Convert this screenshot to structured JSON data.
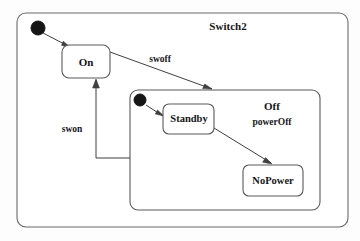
{
  "diagram": {
    "kind": "uml-state-machine",
    "background_color": "#fdfdfd",
    "line_color": "#4a4a4a",
    "text_color": "#16161a",
    "fill_color": "#ffffff"
  },
  "outer_state": {
    "title": "Switch2",
    "title_x": 228,
    "title_y": 26,
    "box": {
      "x": 17,
      "y": 13,
      "w": 331,
      "h": 214,
      "r": 9
    }
  },
  "initial_nodes": [
    {
      "name": "initial-outer",
      "cx": 38,
      "cy": 28,
      "r": 7
    },
    {
      "name": "initial-off",
      "cx": 140,
      "cy": 100,
      "r": 6
    }
  ],
  "states": [
    {
      "id": "on",
      "label": "On",
      "box": {
        "x": 62,
        "y": 45,
        "w": 48,
        "h": 33,
        "r": 7
      },
      "label_x": 86,
      "label_y": 62
    },
    {
      "id": "standby",
      "label": "Standby",
      "box": {
        "x": 163,
        "y": 104,
        "w": 51,
        "h": 30,
        "r": 6
      },
      "label_x": 189,
      "label_y": 119
    },
    {
      "id": "nopower",
      "label": "NoPower",
      "box": {
        "x": 243,
        "y": 165,
        "w": 60,
        "h": 31,
        "r": 6
      },
      "label_x": 273,
      "label_y": 181
    }
  ],
  "composite_state": {
    "id": "off",
    "title": "Off",
    "title_x": 272,
    "title_y": 106,
    "box": {
      "x": 130,
      "y": 90,
      "w": 190,
      "h": 120,
      "r": 8
    }
  },
  "transitions": [
    {
      "id": "start-to-on",
      "label": "",
      "path": "M 43 33 L 70 47",
      "arrow_at": [
        70,
        47
      ],
      "arrow_angle": 27
    },
    {
      "id": "on-to-off",
      "label": "swoff",
      "label_x": 160,
      "label_y": 60,
      "path": "M 110 52 L 212 89",
      "arrow_at": [
        212,
        89
      ],
      "arrow_angle": 20
    },
    {
      "id": "off-to-on",
      "label": "swon",
      "label_x": 72,
      "label_y": 130,
      "path": "M 130 158 L 96 158 L 96 80",
      "arrow_at": [
        96,
        80
      ],
      "arrow_angle": -90
    },
    {
      "id": "start-to-standby",
      "label": "",
      "path": "M 146 105 L 163 116",
      "arrow_at": [
        163,
        116
      ],
      "arrow_angle": 33
    },
    {
      "id": "standby-to-nopower",
      "label": "powerOff",
      "label_x": 272,
      "label_y": 123,
      "path": "M 214 128 L 271 163",
      "arrow_at": [
        271,
        163
      ],
      "arrow_angle": 32
    }
  ]
}
